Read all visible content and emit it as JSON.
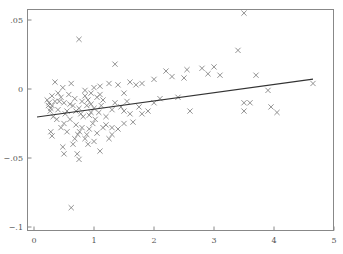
{
  "chart_data": {
    "type": "scatter",
    "title": "",
    "xlabel": "",
    "ylabel": "",
    "xlim": [
      -0.1,
      5.0
    ],
    "ylim": [
      -0.1,
      0.06
    ],
    "grid": false,
    "legend": null,
    "x_ticks": [
      0,
      1,
      2,
      3,
      4,
      5
    ],
    "x_tick_labels": [
      "0",
      "1",
      "2",
      "3",
      "4",
      "5"
    ],
    "y_ticks": [
      0.05,
      0,
      -0.05,
      -0.1
    ],
    "y_tick_labels": [
      ".05",
      "0",
      "−.05",
      "−.1"
    ],
    "marker": "x",
    "marker_color": "#777777",
    "line_color": "#333333",
    "fit_line": {
      "x": [
        0.05,
        4.65
      ],
      "y": [
        -0.0203,
        0.0072
      ]
    },
    "points": [
      [
        0.75,
        0.036
      ],
      [
        0.62,
        -0.086
      ],
      [
        3.5,
        0.055
      ],
      [
        3.4,
        0.028
      ],
      [
        4.65,
        0.004
      ],
      [
        3.7,
        0.01
      ],
      [
        3.9,
        -0.001
      ],
      [
        3.5,
        -0.01
      ],
      [
        3.6,
        -0.01
      ],
      [
        3.5,
        -0.016
      ],
      [
        3.95,
        -0.013
      ],
      [
        4.05,
        -0.017
      ],
      [
        2.2,
        0.013
      ],
      [
        2.3,
        0.009
      ],
      [
        2.5,
        0.008
      ],
      [
        2.8,
        0.015
      ],
      [
        2.9,
        0.011
      ],
      [
        3.0,
        0.016
      ],
      [
        3.1,
        0.01
      ],
      [
        2.55,
        0.014
      ],
      [
        2.0,
        0.007
      ],
      [
        1.35,
        0.018
      ],
      [
        1.6,
        0.005
      ],
      [
        1.7,
        0.003
      ],
      [
        1.5,
        -0.003
      ],
      [
        1.55,
        -0.009
      ],
      [
        1.4,
        0.003
      ],
      [
        1.8,
        -0.018
      ],
      [
        2.0,
        -0.01
      ],
      [
        2.4,
        -0.006
      ],
      [
        2.6,
        -0.016
      ],
      [
        1.5,
        -0.016
      ],
      [
        1.6,
        -0.018
      ],
      [
        1.65,
        -0.024
      ],
      [
        1.45,
        -0.013
      ],
      [
        1.2,
        -0.026
      ],
      [
        1.3,
        -0.028
      ],
      [
        1.4,
        -0.029
      ],
      [
        1.5,
        -0.025
      ],
      [
        1.75,
        -0.013
      ],
      [
        1.9,
        -0.016
      ],
      [
        2.1,
        -0.007
      ],
      [
        1.8,
        0.004
      ],
      [
        1.25,
        0.004
      ],
      [
        1.1,
        0.002
      ],
      [
        1.0,
        0.001
      ],
      [
        0.95,
        -0.003
      ],
      [
        0.85,
        -0.005
      ],
      [
        0.9,
        -0.008
      ],
      [
        1.05,
        -0.006
      ],
      [
        0.95,
        -0.011
      ],
      [
        1.0,
        -0.014
      ],
      [
        0.88,
        -0.012
      ],
      [
        0.8,
        -0.009
      ],
      [
        0.75,
        -0.014
      ],
      [
        0.7,
        -0.016
      ],
      [
        0.65,
        -0.012
      ],
      [
        0.78,
        -0.018
      ],
      [
        0.82,
        -0.02
      ],
      [
        0.92,
        -0.019
      ],
      [
        1.02,
        -0.022
      ],
      [
        1.08,
        -0.017
      ],
      [
        1.12,
        -0.012
      ],
      [
        0.98,
        -0.025
      ],
      [
        0.92,
        -0.029
      ],
      [
        1.05,
        -0.032
      ],
      [
        0.88,
        -0.033
      ],
      [
        0.8,
        -0.028
      ],
      [
        0.7,
        -0.026
      ],
      [
        0.6,
        -0.022
      ],
      [
        0.55,
        -0.016
      ],
      [
        0.5,
        -0.01
      ],
      [
        0.45,
        -0.006
      ],
      [
        0.4,
        -0.003
      ],
      [
        0.48,
        0.001
      ],
      [
        0.58,
        -0.004
      ],
      [
        0.62,
        0.004
      ],
      [
        0.35,
        0.005
      ],
      [
        0.3,
        -0.012
      ],
      [
        0.25,
        -0.01
      ],
      [
        0.28,
        -0.014
      ],
      [
        0.22,
        -0.008
      ],
      [
        0.27,
        -0.016
      ],
      [
        0.32,
        -0.02
      ],
      [
        0.38,
        -0.022
      ],
      [
        0.3,
        -0.005
      ],
      [
        0.42,
        -0.009
      ],
      [
        0.5,
        -0.025
      ],
      [
        0.45,
        -0.028
      ],
      [
        0.55,
        -0.031
      ],
      [
        0.28,
        -0.031
      ],
      [
        0.3,
        -0.034
      ],
      [
        0.48,
        -0.042
      ],
      [
        0.5,
        -0.047
      ],
      [
        0.72,
        -0.047
      ],
      [
        0.75,
        -0.051
      ],
      [
        0.73,
        -0.033
      ],
      [
        0.76,
        -0.031
      ],
      [
        0.68,
        -0.036
      ],
      [
        0.65,
        -0.04
      ],
      [
        0.85,
        -0.036
      ],
      [
        0.9,
        -0.04
      ],
      [
        1.0,
        -0.038
      ],
      [
        1.1,
        -0.045
      ],
      [
        1.25,
        -0.036
      ],
      [
        1.3,
        -0.033
      ],
      [
        1.15,
        -0.028
      ],
      [
        1.2,
        -0.02
      ],
      [
        1.3,
        -0.015
      ],
      [
        1.35,
        -0.01
      ],
      [
        1.1,
        -0.004
      ],
      [
        0.85,
        -0.001
      ],
      [
        0.68,
        -0.007
      ],
      [
        0.6,
        -0.011
      ],
      [
        0.52,
        -0.018
      ],
      [
        0.4,
        -0.015
      ],
      [
        0.35,
        -0.009
      ],
      [
        0.24,
        -0.012
      ],
      [
        0.95,
        -0.017
      ],
      [
        1.15,
        -0.008
      ]
    ]
  }
}
